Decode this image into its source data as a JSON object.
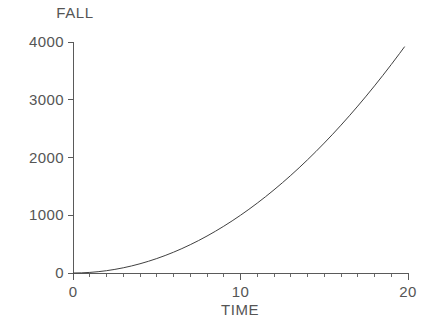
{
  "chart_data": {
    "type": "line",
    "title": "",
    "xlabel": "TIME",
    "ylabel": "FALL",
    "xlim": [
      0,
      20
    ],
    "ylim": [
      0,
      4000
    ],
    "grid": false,
    "legend": null,
    "x_ticks": [
      0,
      10,
      20
    ],
    "x_tick_labels": [
      "0",
      "10",
      "20"
    ],
    "x_minor_tick_step": 1,
    "y_ticks": [
      0,
      1000,
      2000,
      3000,
      4000
    ],
    "y_tick_labels": [
      "0",
      "1000",
      "2000",
      "3000",
      "4000"
    ],
    "series": [
      {
        "name": "FALL",
        "relation": "FALL = 10 * TIME^2",
        "color": "#404040",
        "x": [
          0,
          0.5,
          1,
          1.5,
          2,
          2.5,
          3,
          3.5,
          4,
          4.5,
          5,
          5.5,
          6,
          6.5,
          7,
          7.5,
          8,
          8.5,
          9,
          9.5,
          10,
          10.5,
          11,
          11.5,
          12,
          12.5,
          13,
          13.5,
          14,
          14.5,
          15,
          15.5,
          16,
          16.5,
          17,
          17.5,
          18,
          18.5,
          19,
          19.5,
          19.8
        ],
        "values": [
          0,
          2.5,
          10,
          22.5,
          40,
          62.5,
          90,
          122.5,
          160,
          202.5,
          250,
          302.5,
          360,
          422.5,
          490,
          562.5,
          640,
          722.5,
          810,
          902.5,
          1000,
          1102.5,
          1210,
          1322.5,
          1440,
          1562.5,
          1690,
          1822.5,
          1960,
          2102.5,
          2250,
          2402.5,
          2560,
          2722.5,
          2890,
          3062.5,
          3240,
          3422.5,
          3610,
          3802.5,
          3920.4
        ]
      }
    ]
  },
  "style": {
    "axis_color": "#5a5a5a",
    "curve_color": "#404040",
    "text_color": "#555555",
    "background": "#ffffff"
  },
  "labels": {
    "y_axis_title": "FALL",
    "x_axis_title": "TIME"
  }
}
